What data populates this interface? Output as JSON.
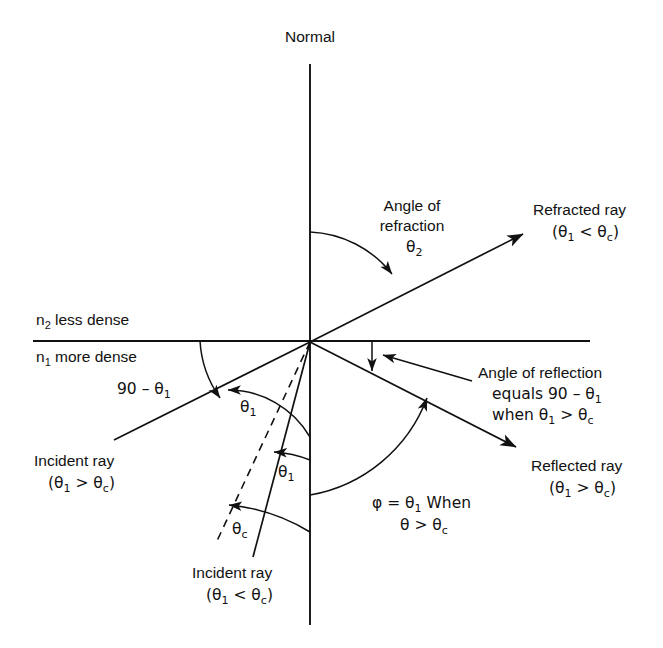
{
  "figure": {
    "title_text": "Normal"
  },
  "labels": {
    "normal": "Normal",
    "medium_upper": "n2 less dense",
    "medium_upper_n": "n",
    "medium_upper_sub": "2",
    "medium_upper_rest": " less dense",
    "medium_lower_n": "n",
    "medium_lower_sub": "1",
    "medium_lower_rest": " more dense",
    "angle_of_refraction_line1": "Angle of",
    "angle_of_refraction_line2": "refraction",
    "angle_of_refraction_symbol": "θ",
    "angle_of_refraction_sub": "2",
    "refracted_ray_line1": "Refracted ray",
    "refracted_ray_cond_open": "(θ",
    "refracted_ray_cond_sub1": "1",
    "refracted_ray_cond_mid": " < θ",
    "refracted_ray_cond_sub2": "c",
    "refracted_ray_cond_close": ")",
    "ninety_minus_theta1": "90 – θ",
    "ninety_minus_theta1_sub": "1",
    "theta1_upper": "θ",
    "theta1_upper_sub": "1",
    "theta1_lower": "θ",
    "theta1_lower_sub": "1",
    "theta_c": "θ",
    "theta_c_sub": "c",
    "angle_of_reflection_line1": "Angle of reflection",
    "angle_of_reflection_line2_pre": "equals 90 – θ",
    "angle_of_reflection_line2_sub": "1",
    "angle_of_reflection_line3_pre": "when θ",
    "angle_of_reflection_line3_sub1": "1",
    "angle_of_reflection_line3_mid": " > θ",
    "angle_of_reflection_line3_sub2": "c",
    "reflected_ray_line1": "Reflected ray",
    "reflected_ray_cond_open": "(θ",
    "reflected_ray_cond_sub1": "1",
    "reflected_ray_cond_mid": " > θ",
    "reflected_ray_cond_sub2": "c",
    "reflected_ray_cond_close": ")",
    "incident_ray_upper_line1": "Incident ray",
    "incident_ray_upper_cond_open": "(θ",
    "incident_ray_upper_cond_sub1": "1",
    "incident_ray_upper_cond_mid": " > θ",
    "incident_ray_upper_cond_sub2": "c",
    "incident_ray_upper_cond_close": ")",
    "incident_ray_lower_line1": "Incident ray",
    "incident_ray_lower_cond_open": "(θ",
    "incident_ray_lower_cond_sub1": "1",
    "incident_ray_lower_cond_mid": " < θ",
    "incident_ray_lower_cond_sub2": "c",
    "incident_ray_lower_cond_close": ")",
    "phi_line1_pre": "φ = θ",
    "phi_line1_sub": "1",
    "phi_line1_post": " When",
    "phi_line2_pre": "θ > θ",
    "phi_line2_sub": "c"
  },
  "colors": {
    "stroke": "#111111",
    "background": "#ffffff",
    "text": "#111111"
  },
  "geometry": {
    "origin_x": 310,
    "origin_y": 342,
    "normal_top_y": 64,
    "normal_bottom_y": 625,
    "interface_left_x": 33,
    "interface_right_x": 590,
    "interface_y": 341
  }
}
